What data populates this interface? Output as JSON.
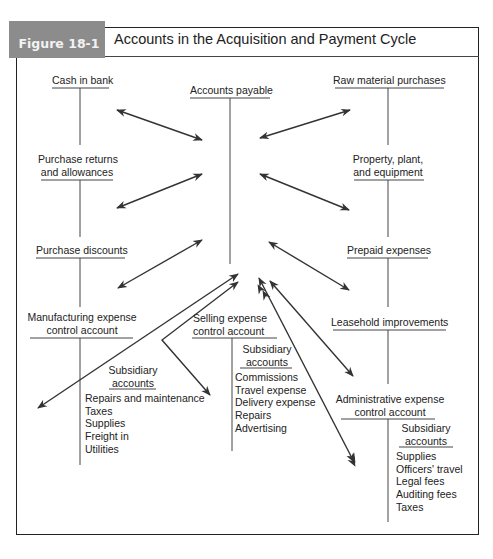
{
  "figure": {
    "label": "Figure 18-1",
    "title": "Accounts in the Acquisition and Payment Cycle",
    "tab_color": "#8c8c8c"
  },
  "accounts": {
    "cash_in_bank": "Cash in bank",
    "accounts_payable": "Accounts payable",
    "raw_material_purchases": "Raw material purchases",
    "purchase_returns_1": "Purchase returns",
    "purchase_returns_2": "and allowances",
    "property_1": "Property, plant,",
    "property_2": "and equipment",
    "purchase_discounts": "Purchase discounts",
    "prepaid_expenses": "Prepaid expenses",
    "manufacturing_1": "Manufacturing expense",
    "manufacturing_2": "control account",
    "selling_1": "Selling expense",
    "selling_2": "control account",
    "leasehold": "Leasehold improvements",
    "administrative_1": "Administrative expense",
    "administrative_2": "control account"
  },
  "subsidiary": {
    "heading_1": "Subsidiary",
    "heading_2": "accounts",
    "manufacturing": [
      "Repairs and maintenance",
      "Taxes",
      "Supplies",
      "Freight in",
      "Utilities"
    ],
    "selling": [
      "Commissions",
      "Travel expense",
      "Delivery expense",
      "Repairs",
      "Advertising"
    ],
    "administrative": [
      "Supplies",
      "Officers' travel",
      "Legal fees",
      "Auditing fees",
      "Taxes"
    ]
  }
}
